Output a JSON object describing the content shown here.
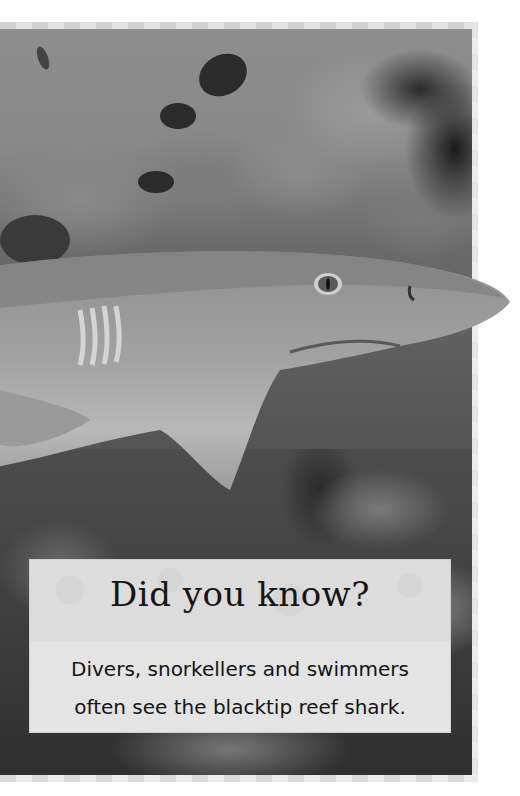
{
  "page": {
    "photo": {
      "subject": "blacktip reef shark",
      "description": "Greyscale underwater photo of a blacktip reef shark swimming over coral reef with small fish above"
    },
    "callout": {
      "title": "Did you know?",
      "body_lines": [
        "Divers, snorkellers and swimmers",
        "often see the blacktip reef shark."
      ]
    },
    "colors": {
      "frame_light": "#ececec",
      "frame_dark": "#d9d9d9",
      "callout_bg": "#e4e4e4",
      "text": "#151515"
    }
  }
}
